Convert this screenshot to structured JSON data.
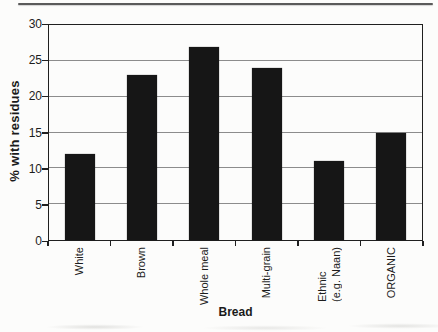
{
  "chart_data": {
    "type": "bar",
    "title": "",
    "xlabel": "Bread",
    "ylabel": "% with residues",
    "categories": [
      "White",
      "Brown",
      "Whole meal",
      "Multi-grain",
      "Ethnic\n(e.g. Naan)",
      "ORGANIC"
    ],
    "values": [
      12,
      23,
      27,
      24,
      11,
      15
    ],
    "ylim": [
      0,
      30
    ],
    "yticks": [
      0,
      5,
      10,
      15,
      20,
      25,
      30
    ],
    "grid": true,
    "legend_position": "none",
    "bar_color": "#161616",
    "axis_color": "#1f1f1f",
    "gridline_color": "#8c8c8c"
  }
}
